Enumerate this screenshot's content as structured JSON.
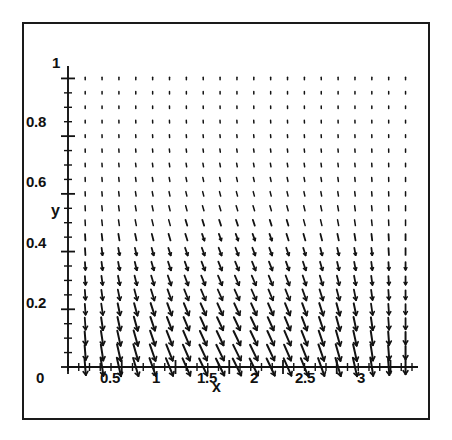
{
  "figure": {
    "background": "#ffffff",
    "frame_color": "#1a1a1a",
    "ink_color": "#121212"
  },
  "chart_data": {
    "type": "scatter",
    "subtype": "vector-field",
    "title": "",
    "xlabel": "x",
    "ylabel": "y",
    "xlim": [
      0,
      3.2
    ],
    "ylim": [
      0,
      1.05
    ],
    "grid": false,
    "legend": null,
    "xticks": [
      0,
      0.5,
      1,
      1.5,
      2,
      2.5,
      3
    ],
    "xtick_labels": [
      "0",
      "0.5",
      "1",
      "1.5",
      "2",
      "2.5",
      "3"
    ],
    "xminor_step": 0.1,
    "yticks": [
      0,
      0.2,
      0.4,
      0.6,
      0.8,
      1
    ],
    "ytick_labels": [
      "0",
      "0.2",
      "0.4",
      "0.6",
      "0.8",
      "1"
    ],
    "yminor_step": 0.05,
    "field": {
      "nx": 20,
      "ny": 21,
      "x_start": 0.16,
      "x_end": 3.14,
      "y_start": 0.0,
      "y_end": 1.0,
      "u_formula": "sin(x) * (1 - y)^2 * 0.55",
      "v_formula": "-(0.18 + 0.92 * (1 - y)^2)",
      "arrow_scale": 0.82,
      "head_style": "solid-barb",
      "description": "Direction field of arrows: nearly vertical and short at large y, lengthening and fanning horizontally near y = 0; horizontal component follows sin(x), pointing right for small x, straight down near x = 1.6, and left-leaning toward x = 3."
    }
  }
}
